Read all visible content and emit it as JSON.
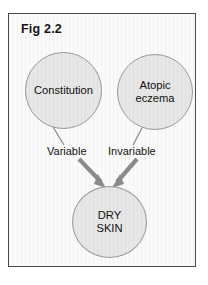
{
  "figure": {
    "title": "Fig 2.2",
    "nodes": [
      {
        "id": "constitution",
        "label": "Constitution"
      },
      {
        "id": "atopic-eczema",
        "label_line1": "Atopic",
        "label_line2": "eczema"
      },
      {
        "id": "dry-skin",
        "label_line1": "DRY",
        "label_line2": "SKIN"
      }
    ],
    "edges": [
      {
        "id": "constitution-to-dry-skin",
        "label": "Variable"
      },
      {
        "id": "atopic-eczema-to-dry-skin",
        "label": "Invariable"
      }
    ],
    "colors": {
      "frame_border": "#4a4a4a",
      "page_background": "#ffffff",
      "figure_background": "#fbfbfb",
      "node_fill": "#e7e7e7",
      "node_stroke": "#9a9a9a",
      "arrow": "#8c8c8c",
      "connector": "#8c8c8c",
      "text": "#111111"
    }
  }
}
